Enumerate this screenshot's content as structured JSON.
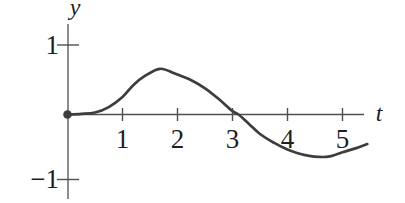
{
  "figure": {
    "y_axis_label": "y",
    "t_axis_label": "t",
    "y_tick_labels": [
      "1",
      "−1"
    ],
    "t_tick_labels": [
      "1",
      "2",
      "3",
      "4",
      "5"
    ]
  },
  "colors": {
    "background": "#ffffff",
    "curve": "#3d3d3d",
    "axis": "#4f4f4f",
    "text": "#1f1f1f"
  },
  "chart_data": {
    "type": "line",
    "title": "",
    "xlabel": "t",
    "ylabel": "y",
    "x_ticks": [
      1,
      2,
      3,
      4,
      5
    ],
    "y_ticks": [
      1,
      -1
    ],
    "xlim": [
      0,
      5.6
    ],
    "ylim": [
      -1.3,
      1.35
    ],
    "grid": false,
    "legend": "none",
    "origin_marker": {
      "t": 0,
      "y": 0,
      "style": "filled-dot"
    },
    "series": [
      {
        "name": "y(t)",
        "points": [
          [
            0.0,
            0.0
          ],
          [
            0.25,
            0.01
          ],
          [
            0.5,
            0.03
          ],
          [
            0.75,
            0.11
          ],
          [
            1.0,
            0.26
          ],
          [
            1.2,
            0.44
          ],
          [
            1.4,
            0.57
          ],
          [
            1.68,
            0.68
          ],
          [
            1.95,
            0.61
          ],
          [
            2.25,
            0.51
          ],
          [
            2.5,
            0.39
          ],
          [
            2.75,
            0.23
          ],
          [
            3.0,
            0.05
          ],
          [
            3.11,
            0.0
          ],
          [
            3.3,
            -0.14
          ],
          [
            3.5,
            -0.29
          ],
          [
            3.75,
            -0.42
          ],
          [
            4.0,
            -0.52
          ],
          [
            4.3,
            -0.6
          ],
          [
            4.7,
            -0.63
          ],
          [
            5.0,
            -0.56
          ],
          [
            5.25,
            -0.5
          ],
          [
            5.45,
            -0.44
          ]
        ]
      }
    ]
  }
}
